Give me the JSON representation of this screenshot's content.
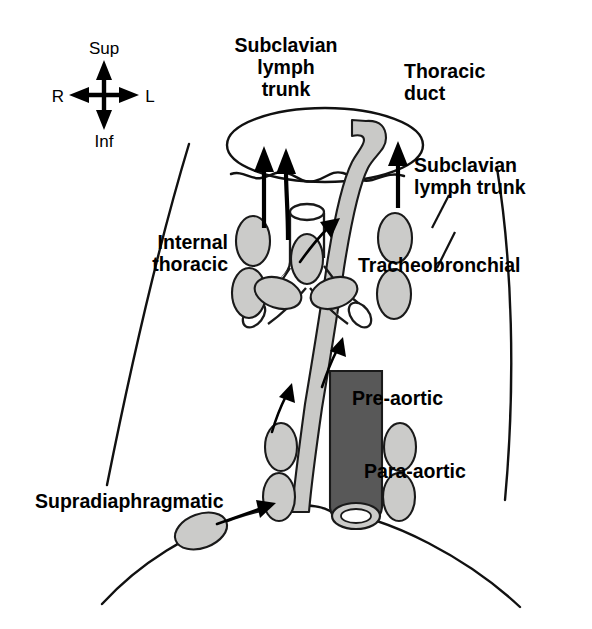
{
  "figure": {
    "background_color": "#ffffff"
  },
  "compass": {
    "name": "orientation-compass",
    "superior": "Sup",
    "inferior": "Inf",
    "right": "R",
    "left": "L"
  },
  "labels": {
    "subclavian_trunk_top": "Subclavian\nlymph\ntrunk",
    "subclavian_trunk_top_line1": "Subclavian",
    "subclavian_trunk_top_line2": "lymph",
    "subclavian_trunk_top_line3": "trunk",
    "thoracic_duct_line1": "Thoracic",
    "thoracic_duct_line2": "duct",
    "subclavian_trunk_right_line1": "Subclavian",
    "subclavian_trunk_right_line2": "lymph trunk",
    "internal_thoracic_line1": "Internal",
    "internal_thoracic_line2": "thoracic",
    "tracheobronchial": "Tracheobronchial",
    "pre_aortic": "Pre-aortic",
    "para_aortic": "Para-aortic",
    "supradiaphragmatic": "Supradiaphragmatic"
  },
  "colors": {
    "lymph_node_fill": "#cbcbc9",
    "lymph_node_stroke": "#1a1a1a",
    "aorta_fill": "#585858",
    "thoracic_duct_fill": "#c9c9c7",
    "outline": "#111111",
    "text": "#000000"
  },
  "structures": {
    "lymph_nodes_count": 14,
    "aorta_label": "aorta",
    "trachea_label": "trachea",
    "bronchi_label": "main bronchi",
    "diaphragm_label": "diaphragm",
    "venous_angle_label": "venous confluence"
  }
}
